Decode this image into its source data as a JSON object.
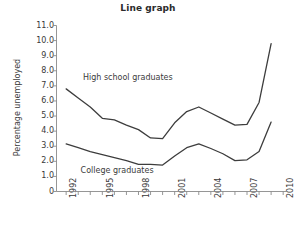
{
  "chart_data": {
    "type": "line",
    "title": "Line graph",
    "xlabel": "",
    "ylabel": "Percentage unemployed",
    "xlim": [
      1991.2,
      2010.4
    ],
    "ylim": [
      0,
      11.0
    ],
    "grid": false,
    "legend_position": "inline-annotations",
    "x": [
      1992,
      1993,
      1994,
      1995,
      1996,
      1997,
      1998,
      1999,
      2000,
      2001,
      2002,
      2003,
      2004,
      2005,
      2006,
      2007,
      2008,
      2009
    ],
    "x_tick_labels": [
      "1992",
      "1995",
      "1998",
      "2001",
      "2004",
      "2007",
      "2010"
    ],
    "x_tick_values": [
      1992,
      1995,
      1998,
      2001,
      2004,
      2007,
      2010
    ],
    "y_tick_labels": [
      "0",
      "1.0",
      "2.0",
      "3.0",
      "4.0",
      "5.0",
      "6.0",
      "7.0",
      "8.0",
      "9.0",
      "10.0",
      "11.0"
    ],
    "y_tick_values": [
      0,
      1.0,
      2.0,
      3.0,
      4.0,
      5.0,
      6.0,
      7.0,
      8.0,
      9.0,
      10.0,
      11.0
    ],
    "series": [
      {
        "name": "High school graduates",
        "values": [
          6.8,
          6.2,
          5.6,
          4.85,
          4.75,
          4.4,
          4.1,
          3.55,
          3.5,
          4.55,
          5.3,
          5.6,
          5.2,
          4.8,
          4.4,
          4.45,
          5.9,
          9.8
        ]
      },
      {
        "name": "College graduates",
        "values": [
          3.15,
          2.9,
          2.65,
          2.45,
          2.25,
          2.05,
          1.8,
          1.8,
          1.75,
          2.35,
          2.9,
          3.15,
          2.85,
          2.5,
          2.05,
          2.1,
          2.65,
          4.6
        ]
      }
    ],
    "annotations": [
      {
        "text": "High school graduates",
        "x": 1993.4,
        "y": 7.55
      },
      {
        "text": "College graduates",
        "x": 1993.2,
        "y": 1.35
      }
    ]
  }
}
